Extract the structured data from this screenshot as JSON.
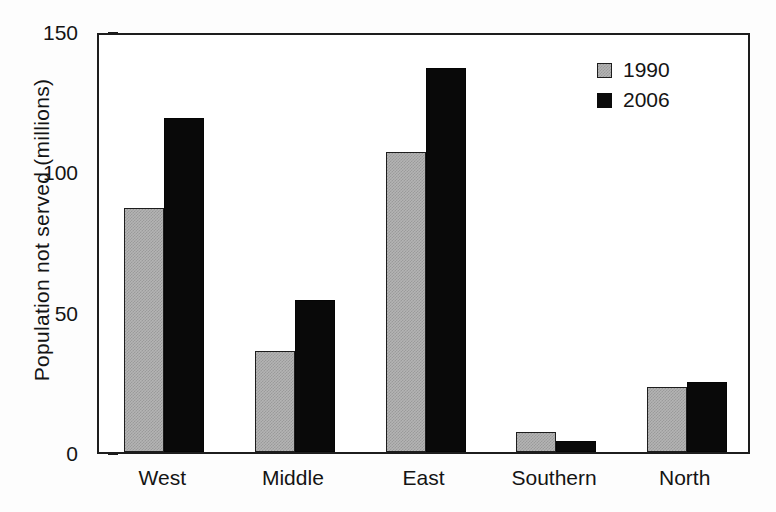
{
  "chart_data": {
    "type": "bar",
    "title": "",
    "subtitle": "",
    "xlabel": "",
    "ylabel": "Population not served  (millions)",
    "categories": [
      "West",
      "Middle",
      "East",
      "Southern",
      "North"
    ],
    "series": [
      {
        "name": "1990",
        "color": "#b4b4b4",
        "values": [
          87,
          36,
          107,
          7,
          23
        ]
      },
      {
        "name": "2006",
        "color": "#0a0a0a",
        "values": [
          119,
          54,
          137,
          4,
          25
        ]
      }
    ],
    "ylim": [
      0,
      150
    ],
    "yticks": [
      0,
      50,
      100,
      150
    ],
    "ytick_labels": [
      "0",
      "50",
      "100",
      "150"
    ],
    "grid": false,
    "legend_position": "top-right",
    "legend_entries": [
      "1990",
      "2006"
    ]
  },
  "figure": {
    "background_color": "#fdfdfd",
    "plot_background_color": "#ffffff",
    "axis_color": "#1d1d1d"
  }
}
